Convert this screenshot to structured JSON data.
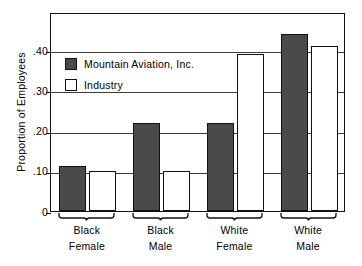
{
  "chart_data": {
    "type": "bar",
    "title": "",
    "xlabel": "",
    "ylabel": "Proportion of Employees",
    "categories": [
      "Black Female",
      "Black Male",
      "White Female",
      "White Male"
    ],
    "category_lines": [
      [
        "Black",
        "Female"
      ],
      [
        "Black",
        "Male"
      ],
      [
        "White",
        "Female"
      ],
      [
        "White",
        "Male"
      ]
    ],
    "series": [
      {
        "name": "Mountain Aviation, Inc.",
        "color": "#4a4a4a",
        "values": [
          0.112,
          0.22,
          0.22,
          0.44
        ]
      },
      {
        "name": "Industry",
        "color": "#ffffff",
        "values": [
          0.1,
          0.1,
          0.39,
          0.41
        ]
      }
    ],
    "ylim": [
      0,
      0.495
    ],
    "yticks": [
      0,
      0.1,
      0.2,
      0.3,
      0.4
    ],
    "ytick_labels": [
      "0",
      ".10",
      ".20",
      ".30",
      ".40"
    ],
    "grid": true,
    "legend_position": "upper-left-inside"
  },
  "legend": {
    "entries": [
      {
        "label": "Mountain Aviation, Inc.",
        "swatch": "filled-dark"
      },
      {
        "label": "Industry",
        "swatch": "open-white"
      }
    ]
  },
  "axis": {
    "y_title": "Proportion of Employees"
  }
}
